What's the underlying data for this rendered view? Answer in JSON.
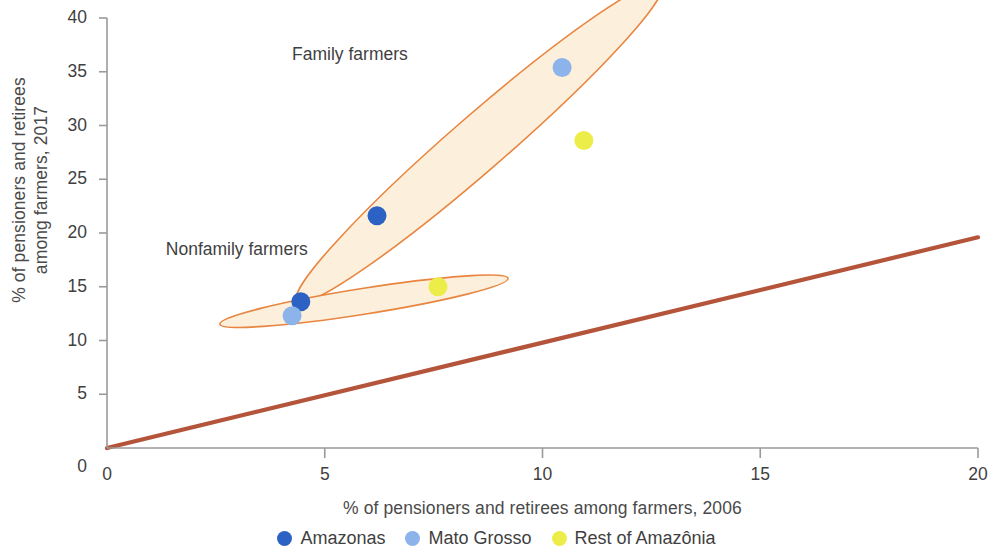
{
  "chart_data": {
    "type": "scatter",
    "title": "",
    "xlabel": "% of pensioners and retirees among farmers, 2006",
    "ylabel_line1": "% of pensioners and retirees",
    "ylabel_line2": "among farmers, 2017",
    "xlim": [
      0,
      20
    ],
    "ylim": [
      0,
      40
    ],
    "xticks": [
      "0",
      "5",
      "10",
      "15",
      "20"
    ],
    "xtick_values": [
      0,
      5,
      10,
      15,
      20
    ],
    "yticks": [
      "0",
      "5",
      "10",
      "15",
      "20",
      "25",
      "30",
      "35",
      "40"
    ],
    "ytick_values": [
      0,
      5,
      10,
      15,
      20,
      25,
      30,
      35,
      40
    ],
    "grid": false,
    "legend_position": "bottom-center",
    "series": [
      {
        "name": "Amazonas",
        "color": "#2b62c4",
        "points": [
          {
            "group": "Family farmers",
            "x": 6.2,
            "y": 21.6
          },
          {
            "group": "Nonfamily farmers",
            "x": 4.45,
            "y": 13.6
          }
        ]
      },
      {
        "name": "Mato Grosso",
        "color": "#8cb4ea",
        "points": [
          {
            "group": "Family farmers",
            "x": 10.45,
            "y": 35.4
          },
          {
            "group": "Nonfamily farmers",
            "x": 4.25,
            "y": 12.3
          }
        ]
      },
      {
        "name": "Rest of Amazônia",
        "color": "#eded4a",
        "points": [
          {
            "group": "Family farmers",
            "x": 10.95,
            "y": 28.6
          },
          {
            "group": "Nonfamily farmers",
            "x": 7.6,
            "y": 15.0
          }
        ]
      }
    ],
    "reference_line": {
      "name": "45-degree parity line",
      "color": "#b4543a",
      "from": [
        0,
        0
      ],
      "to": [
        20,
        19.6
      ]
    },
    "annotations": [
      {
        "name": "Family farmers",
        "label": "Family farmers",
        "label_x": 4.25,
        "label_y": 36.6,
        "ellipse": {
          "cx": 8.55,
          "cy": 28.4,
          "rx": 5.55,
          "ry": 2.55,
          "rotation": -41,
          "fill": "#fcefdc",
          "stroke": "#e8853f"
        }
      },
      {
        "name": "Nonfamily farmers",
        "label": "Nonfamily farmers",
        "label_x": 1.35,
        "label_y": 18.4,
        "ellipse": {
          "cx": 5.9,
          "cy": 13.65,
          "rx": 3.35,
          "ry": 1.2,
          "rotation": -9,
          "fill": "#fcefdc",
          "stroke": "#e8853f"
        }
      }
    ]
  },
  "legend": {
    "items": [
      {
        "label": "Amazonas",
        "color": "#2b62c4"
      },
      {
        "label": "Mato Grosso",
        "color": "#8cb4ea"
      },
      {
        "label": "Rest of Amazônia",
        "color": "#eded4a"
      }
    ]
  },
  "axes": {
    "axis_color": "#9a9a9a"
  }
}
